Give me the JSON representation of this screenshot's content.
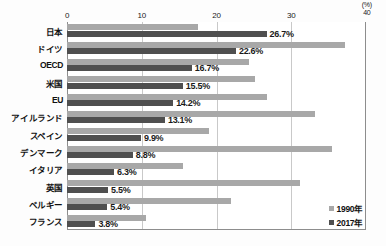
{
  "chart_data": {
    "type": "bar",
    "orientation": "horizontal",
    "title": "",
    "xlabel": "(%)",
    "ylabel": "",
    "unit": "(%)",
    "xlim": [
      0,
      40
    ],
    "xticks": [
      0,
      10,
      20,
      30,
      40
    ],
    "xtick_labels": [
      "0",
      "10",
      "20",
      "30",
      "40"
    ],
    "grid": true,
    "legend_position": "bottom-right",
    "categories": [
      "日本",
      "ドイツ",
      "OECD",
      "米国",
      "EU",
      "アイルランド",
      "スペイン",
      "デンマーク",
      "イタリア",
      "英国",
      "ベルギー",
      "フランス"
    ],
    "series": [
      {
        "name": "1990年",
        "color": "#a8a8a8",
        "values": [
          17.5,
          37.2,
          24.4,
          25.1,
          26.8,
          33.2,
          19.0,
          35.5,
          15.5,
          31.2,
          22.0,
          10.6
        ],
        "labels": [
          "",
          "",
          "",
          "",
          "",
          "",
          "",
          "",
          "",
          "",
          "",
          ""
        ]
      },
      {
        "name": "2017年",
        "color": "#4f4f4f",
        "values": [
          26.7,
          22.6,
          16.7,
          15.5,
          14.2,
          13.1,
          9.9,
          8.8,
          6.3,
          5.5,
          5.4,
          3.8
        ],
        "labels": [
          "26.7%",
          "22.6%",
          "16.7%",
          "15.5%",
          "14.2%",
          "13.1%",
          "9.9%",
          "8.8%",
          "6.3%",
          "5.5%",
          "5.4%",
          "3.8%"
        ]
      }
    ]
  },
  "legend": {
    "items": [
      {
        "label": "1990年",
        "color": "#a8a8a8"
      },
      {
        "label": "2017年",
        "color": "#4f4f4f"
      }
    ]
  },
  "colors": {
    "series_1990": "#a8a8a8",
    "series_2017": "#4f4f4f",
    "grid": "#c9c9c9",
    "frame": "#8d8d8d",
    "text": "#111111",
    "background": "#ffffff"
  }
}
